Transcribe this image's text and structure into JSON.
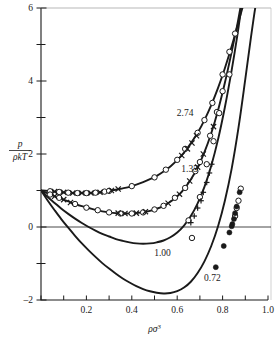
{
  "figure": {
    "background": "#ffffff",
    "ink": "#1a1a1a",
    "axis_label_y_num": "p",
    "axis_label_y_den": "ρkT",
    "axis_label_x_base": "ρσ",
    "axis_label_x_exp": "3"
  },
  "chart_data": {
    "type": "line",
    "title": "",
    "subtitle": "",
    "xlabel": "ρσ³",
    "ylabel": "p/ρkT",
    "xlim": [
      0.0,
      1.0
    ],
    "ylim": [
      -2.0,
      6.0
    ],
    "grid": false,
    "legend_position": "inline-curve-labels",
    "xticks": [
      0.0,
      0.1,
      0.2,
      0.3,
      0.4,
      0.5,
      0.6,
      0.7,
      0.8,
      0.9,
      1.0
    ],
    "xticklabels": [
      "",
      "",
      "0.2",
      "",
      "0.4",
      "",
      "0.6",
      "",
      "0.8",
      "",
      "1.0"
    ],
    "yticks": [
      -2,
      -1,
      0,
      1,
      2,
      3,
      4,
      5,
      6
    ],
    "yticklabels": [
      "-2",
      "",
      "0",
      "",
      "2",
      "",
      "4",
      "",
      "6"
    ],
    "zero_line": 0,
    "annotations": [
      {
        "text": "2.74",
        "x": 0.635,
        "y": 3.05
      },
      {
        "text": "1.35",
        "x": 0.655,
        "y": 1.51
      },
      {
        "text": "1.00",
        "x": 0.535,
        "y": -0.79
      },
      {
        "text": "0.72",
        "x": 0.755,
        "y": -1.48
      }
    ],
    "series": [
      {
        "name": "2.74",
        "label": "2.74",
        "marker": "open-circle",
        "secondary_marker": "cross",
        "line": "solid",
        "curve": [
          [
            0.0,
            1.0
          ],
          [
            0.03,
            0.99
          ],
          [
            0.06,
            0.97
          ],
          [
            0.09,
            0.95
          ],
          [
            0.12,
            0.94
          ],
          [
            0.15,
            0.93
          ],
          [
            0.18,
            0.93
          ],
          [
            0.21,
            0.93
          ],
          [
            0.24,
            0.94
          ],
          [
            0.27,
            0.96
          ],
          [
            0.3,
            0.99
          ],
          [
            0.33,
            1.02
          ],
          [
            0.36,
            1.06
          ],
          [
            0.39,
            1.1
          ],
          [
            0.42,
            1.16
          ],
          [
            0.45,
            1.23
          ],
          [
            0.48,
            1.31
          ],
          [
            0.51,
            1.4
          ],
          [
            0.54,
            1.52
          ],
          [
            0.57,
            1.66
          ],
          [
            0.6,
            1.83
          ],
          [
            0.63,
            2.04
          ],
          [
            0.66,
            2.29
          ],
          [
            0.69,
            2.58
          ],
          [
            0.72,
            2.93
          ],
          [
            0.75,
            3.34
          ],
          [
            0.78,
            3.81
          ],
          [
            0.81,
            4.35
          ],
          [
            0.84,
            4.95
          ],
          [
            0.865,
            5.5
          ],
          [
            0.885,
            5.95
          ],
          [
            0.895,
            6.15
          ]
        ],
        "points_circle": [
          [
            0.04,
            0.98
          ],
          [
            0.08,
            0.96
          ],
          [
            0.12,
            0.94
          ],
          [
            0.16,
            0.93
          ],
          [
            0.2,
            0.93
          ],
          [
            0.24,
            0.94
          ],
          [
            0.28,
            0.97
          ],
          [
            0.3,
            0.99
          ],
          [
            0.4,
            1.12
          ],
          [
            0.5,
            1.36
          ],
          [
            0.55,
            1.57
          ],
          [
            0.6,
            1.84
          ],
          [
            0.635,
            2.14
          ],
          [
            0.69,
            2.58
          ],
          [
            0.72,
            2.93
          ],
          [
            0.755,
            3.4
          ],
          [
            0.8,
            4.18
          ],
          [
            0.83,
            4.8
          ],
          [
            0.855,
            5.3
          ]
        ],
        "points_cross": [
          [
            0.06,
            0.97
          ],
          [
            0.1,
            0.95
          ],
          [
            0.14,
            0.93
          ],
          [
            0.18,
            0.93
          ],
          [
            0.22,
            0.93
          ],
          [
            0.26,
            0.95
          ],
          [
            0.31,
            1.0
          ],
          [
            0.34,
            1.04
          ],
          [
            0.62,
            1.96
          ],
          [
            0.645,
            2.14
          ],
          [
            0.665,
            2.3
          ],
          [
            0.685,
            2.5
          ]
        ]
      },
      {
        "name": "1.35",
        "label": "1.35",
        "marker": "open-circle",
        "secondary_marker": "cross",
        "line": "solid",
        "curve": [
          [
            0.0,
            1.0
          ],
          [
            0.03,
            0.92
          ],
          [
            0.06,
            0.84
          ],
          [
            0.09,
            0.77
          ],
          [
            0.12,
            0.7
          ],
          [
            0.15,
            0.63
          ],
          [
            0.18,
            0.57
          ],
          [
            0.21,
            0.52
          ],
          [
            0.24,
            0.47
          ],
          [
            0.27,
            0.43
          ],
          [
            0.3,
            0.4
          ],
          [
            0.33,
            0.38
          ],
          [
            0.36,
            0.37
          ],
          [
            0.39,
            0.37
          ],
          [
            0.42,
            0.38
          ],
          [
            0.45,
            0.4
          ],
          [
            0.48,
            0.44
          ],
          [
            0.51,
            0.5
          ],
          [
            0.54,
            0.58
          ],
          [
            0.57,
            0.69
          ],
          [
            0.6,
            0.84
          ],
          [
            0.63,
            1.04
          ],
          [
            0.66,
            1.3
          ],
          [
            0.69,
            1.63
          ],
          [
            0.72,
            2.05
          ],
          [
            0.75,
            2.57
          ],
          [
            0.78,
            3.2
          ],
          [
            0.81,
            3.95
          ],
          [
            0.84,
            4.8
          ],
          [
            0.865,
            5.55
          ],
          [
            0.88,
            6.05
          ],
          [
            0.888,
            6.2
          ]
        ],
        "points_circle": [
          [
            0.04,
            0.89
          ],
          [
            0.08,
            0.8
          ],
          [
            0.15,
            0.63
          ],
          [
            0.2,
            0.53
          ],
          [
            0.25,
            0.46
          ],
          [
            0.3,
            0.4
          ],
          [
            0.35,
            0.37
          ],
          [
            0.4,
            0.37
          ],
          [
            0.45,
            0.4
          ],
          [
            0.5,
            0.48
          ],
          [
            0.54,
            0.58
          ],
          [
            0.59,
            0.8
          ],
          [
            0.635,
            1.07
          ],
          [
            0.68,
            1.53
          ],
          [
            0.7,
            1.78
          ],
          [
            0.745,
            2.5
          ],
          [
            0.775,
            3.15
          ],
          [
            0.8,
            3.72
          ]
        ],
        "points_cross": [
          [
            0.06,
            0.84
          ],
          [
            0.1,
            0.75
          ],
          [
            0.13,
            0.67
          ],
          [
            0.34,
            0.38
          ],
          [
            0.37,
            0.37
          ],
          [
            0.42,
            0.38
          ],
          [
            0.46,
            0.42
          ],
          [
            0.56,
            0.65
          ],
          [
            0.61,
            0.9
          ],
          [
            0.655,
            1.26
          ],
          [
            0.69,
            1.64
          ],
          [
            0.715,
            2.0
          ],
          [
            0.76,
            2.75
          ]
        ]
      },
      {
        "name": "1.00",
        "label": "1.00",
        "marker": "open-circle",
        "secondary_marker": "plus",
        "line": "solid",
        "curve": [
          [
            0.0,
            1.0
          ],
          [
            0.03,
            0.82
          ],
          [
            0.06,
            0.66
          ],
          [
            0.09,
            0.5
          ],
          [
            0.12,
            0.36
          ],
          [
            0.15,
            0.23
          ],
          [
            0.18,
            0.11
          ],
          [
            0.21,
            0.0
          ],
          [
            0.24,
            -0.1
          ],
          [
            0.27,
            -0.19
          ],
          [
            0.3,
            -0.26
          ],
          [
            0.33,
            -0.33
          ],
          [
            0.36,
            -0.38
          ],
          [
            0.39,
            -0.42
          ],
          [
            0.42,
            -0.45
          ],
          [
            0.45,
            -0.46
          ],
          [
            0.48,
            -0.45
          ],
          [
            0.51,
            -0.42
          ],
          [
            0.54,
            -0.37
          ],
          [
            0.57,
            -0.28
          ],
          [
            0.6,
            -0.15
          ],
          [
            0.63,
            0.04
          ],
          [
            0.66,
            0.3
          ],
          [
            0.69,
            0.65
          ],
          [
            0.72,
            1.1
          ],
          [
            0.75,
            1.68
          ],
          [
            0.78,
            2.4
          ],
          [
            0.81,
            3.28
          ],
          [
            0.84,
            4.3
          ],
          [
            0.865,
            5.25
          ],
          [
            0.88,
            5.9
          ],
          [
            0.888,
            6.2
          ]
        ],
        "points_circle": [
          [
            0.65,
            0.18
          ],
          [
            0.665,
            -0.3
          ],
          [
            0.7,
            0.82
          ],
          [
            0.73,
            1.72
          ],
          [
            0.76,
            2.35
          ],
          [
            0.785,
            3.12
          ],
          [
            0.83,
            4.18
          ]
        ],
        "points_plus": [
          [
            0.66,
            0.12
          ],
          [
            0.675,
            0.3
          ],
          [
            0.69,
            0.52
          ],
          [
            0.705,
            0.72
          ],
          [
            0.715,
            0.95
          ],
          [
            0.73,
            1.22
          ],
          [
            0.742,
            1.48
          ],
          [
            0.752,
            1.72
          ]
        ]
      },
      {
        "name": "0.72",
        "label": "0.72",
        "marker": "filled-circle",
        "secondary_marker": "open-circle",
        "line": "solid",
        "curve": [
          [
            0.0,
            1.0
          ],
          [
            0.03,
            0.72
          ],
          [
            0.06,
            0.46
          ],
          [
            0.09,
            0.21
          ],
          [
            0.12,
            -0.02
          ],
          [
            0.15,
            -0.24
          ],
          [
            0.18,
            -0.45
          ],
          [
            0.21,
            -0.64
          ],
          [
            0.24,
            -0.82
          ],
          [
            0.27,
            -0.99
          ],
          [
            0.3,
            -1.14
          ],
          [
            0.33,
            -1.28
          ],
          [
            0.36,
            -1.41
          ],
          [
            0.39,
            -1.52
          ],
          [
            0.42,
            -1.62
          ],
          [
            0.45,
            -1.7
          ],
          [
            0.48,
            -1.76
          ],
          [
            0.51,
            -1.8
          ],
          [
            0.54,
            -1.82
          ],
          [
            0.57,
            -1.81
          ],
          [
            0.6,
            -1.76
          ],
          [
            0.63,
            -1.66
          ],
          [
            0.66,
            -1.5
          ],
          [
            0.69,
            -1.26
          ],
          [
            0.72,
            -0.94
          ],
          [
            0.75,
            -0.52
          ],
          [
            0.78,
            0.02
          ],
          [
            0.81,
            0.72
          ],
          [
            0.84,
            1.6
          ],
          [
            0.87,
            2.72
          ],
          [
            0.9,
            4.05
          ],
          [
            0.925,
            5.2
          ],
          [
            0.945,
            6.05
          ],
          [
            0.952,
            6.2
          ]
        ],
        "points_filled": [
          [
            0.77,
            -1.1
          ],
          [
            0.805,
            -0.52
          ],
          [
            0.83,
            -0.15
          ],
          [
            0.843,
            0.08
          ],
          [
            0.85,
            0.22
          ],
          [
            0.855,
            0.38
          ],
          [
            0.862,
            0.56
          ],
          [
            0.875,
            0.95
          ],
          [
            0.84,
            0.02
          ]
        ],
        "points_circle": [
          [
            0.855,
            0.3
          ],
          [
            0.862,
            0.52
          ],
          [
            0.87,
            0.72
          ],
          [
            0.88,
            1.05
          ]
        ]
      }
    ]
  }
}
